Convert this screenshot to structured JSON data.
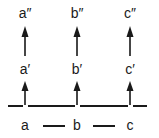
{
  "figure": {
    "background_color": "#ffffff",
    "ink_color": "#1a1a1a",
    "width": 159,
    "height": 138
  },
  "columns": [
    {
      "key": "a",
      "x": 25,
      "base_label": "a",
      "prime_label": "a′",
      "double_prime_label": "a″"
    },
    {
      "key": "b",
      "x": 77,
      "base_label": "b",
      "prime_label": "b′",
      "double_prime_label": "b″"
    },
    {
      "key": "c",
      "x": 130,
      "base_label": "c",
      "prime_label": "c′",
      "double_prime_label": "c″"
    }
  ],
  "rows": {
    "top_label_y": 6,
    "upper_arrow_y": 26,
    "upper_arrow_height": 30,
    "middle_label_y": 62,
    "lower_arrow_y": 81,
    "lower_arrow_height": 24,
    "baseline_y": 105,
    "bottom_label_y": 118
  },
  "baseline": {
    "name": "horizontal-baseline",
    "segments": [
      {
        "left": 8,
        "width": 15
      },
      {
        "left": 28,
        "width": 47
      },
      {
        "left": 80,
        "width": 48
      },
      {
        "left": 133,
        "width": 14
      }
    ]
  },
  "connectors": {
    "name": "bottom-dashes",
    "segments": [
      {
        "left": 43,
        "width": 22
      },
      {
        "left": 93,
        "width": 22
      }
    ]
  },
  "arrow_glyph": {
    "name": "up-arrow",
    "shaft_width": 1.6,
    "head_width": 7,
    "head_height": 10
  }
}
